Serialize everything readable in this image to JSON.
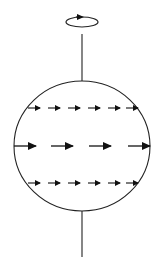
{
  "diagram": {
    "colors": {
      "background": "#ffffff",
      "stroke": "#222222",
      "arrow": "#111111"
    },
    "sphere": {
      "cx": 82,
      "cy": 146,
      "rx": 68,
      "ry": 65
    },
    "axis": {
      "x": 82,
      "top": {
        "y1": 34,
        "y2": 81
      },
      "bottom": {
        "y1": 211,
        "y2": 257
      }
    },
    "rotation_indicator": {
      "icon": "rotation-arrow-icon",
      "cx": 82,
      "cy": 22,
      "rx": 16,
      "ry": 5,
      "direction": "counterclockwise-viewed-from-above"
    },
    "arrow_rows": [
      {
        "name": "upper-latitude",
        "y": 108,
        "size": "small",
        "arrows": [
          {
            "x1": 28,
            "x2": 40
          },
          {
            "x1": 48,
            "x2": 60
          },
          {
            "x1": 68,
            "x2": 80
          },
          {
            "x1": 88,
            "x2": 100
          },
          {
            "x1": 108,
            "x2": 120
          },
          {
            "x1": 126,
            "x2": 138
          }
        ]
      },
      {
        "name": "equator",
        "y": 146,
        "size": "large",
        "arrows": [
          {
            "x1": 14,
            "x2": 36
          },
          {
            "x1": 51,
            "x2": 73
          },
          {
            "x1": 89,
            "x2": 111
          },
          {
            "x1": 128,
            "x2": 150
          }
        ]
      },
      {
        "name": "lower-latitude",
        "y": 183,
        "size": "small",
        "arrows": [
          {
            "x1": 28,
            "x2": 40
          },
          {
            "x1": 48,
            "x2": 60
          },
          {
            "x1": 68,
            "x2": 80
          },
          {
            "x1": 88,
            "x2": 100
          },
          {
            "x1": 108,
            "x2": 120
          },
          {
            "x1": 126,
            "x2": 138
          }
        ]
      }
    ]
  }
}
